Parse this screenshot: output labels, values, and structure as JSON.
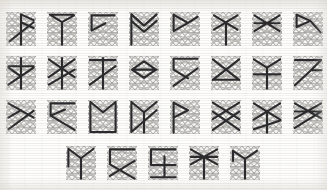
{
  "figure": {
    "canvas": {
      "width": 327,
      "height": 190
    },
    "palette": {
      "background": "#f5f4f1",
      "lattice_line": "#b5b4b1",
      "lattice_node": "#9e9d9a",
      "bold_path": "#2b2b2e"
    },
    "lattice": {
      "columns": 5,
      "rows": 5,
      "cell_width": 30,
      "cell_height": 34,
      "node_radius": 0.85
    },
    "rows": [
      {
        "index": 1,
        "top": 12,
        "left": 6,
        "pitch": 41,
        "count": 8,
        "cells": [
          {
            "id": "r1c1",
            "path": "M 0.50 0.07 L 0.92 0.24 M 0.50 0.07 L 0.50 0.96 M 0.50 0.30 L 0.92 0.47 M 0.12 0.86 L 0.92 0.30"
          },
          {
            "id": "r1c2",
            "path": "M 0.10 0.08 L 0.50 0.30 L 0.50 0.96 M 0.10 0.08 L 0.88 0.08 M 0.50 0.30 L 0.90 0.10"
          },
          {
            "id": "r1c3",
            "path": "M 0.12 0.10 L 0.88 0.10 M 0.12 0.10 L 0.12 0.55 L 0.58 0.33 L 0.12 0.55"
          },
          {
            "id": "r1c4",
            "path": "M 0.08 0.07 L 0.50 0.40 L 0.92 0.07 M 0.08 0.26 L 0.50 0.58 L 0.92 0.26 M 0.08 0.07 L 0.08 0.96"
          },
          {
            "id": "r1c5",
            "path": "M 0.12 0.08 L 0.60 0.32 L 0.12 0.56 L 0.12 0.08 M 0.60 0.32 L 0.92 0.14"
          },
          {
            "id": "r1c6",
            "path": "M 0.10 0.10 L 0.88 0.52 M 0.10 0.52 L 0.88 0.10 M 0.50 0.31 L 0.50 0.96"
          },
          {
            "id": "r1c7",
            "path": "M 0.08 0.10 L 0.92 0.56 M 0.08 0.56 L 0.92 0.10 M 0.08 0.33 L 0.92 0.33"
          },
          {
            "id": "r1c8",
            "path": "M 0.12 0.08 L 0.58 0.26 L 0.12 0.44 L 0.12 0.08 M 0.58 0.26 L 0.92 0.60"
          }
        ]
      },
      {
        "index": 2,
        "top": 56,
        "left": 6,
        "pitch": 41,
        "count": 8,
        "cells": [
          {
            "id": "r2c1",
            "path": "M 0.50 0.06 L 0.50 0.96 M 0.08 0.30 L 0.92 0.30 M 0.08 0.84 L 0.92 0.34 M 0.08 0.34 L 0.50 0.60"
          },
          {
            "id": "r2c2",
            "path": "M 0.50 0.06 L 0.50 0.96 M 0.06 0.10 L 0.92 0.62 M 0.06 0.62 L 0.92 0.10 M 0.06 0.84 L 0.92 0.40"
          },
          {
            "id": "r2c3",
            "path": "M 0.50 0.06 L 0.50 0.96 M 0.06 0.12 L 0.92 0.12 M 0.06 0.84 L 0.92 0.30"
          },
          {
            "id": "r2c4",
            "path": "M 0.50 0.16 L 0.90 0.40 L 0.50 0.64 L 0.10 0.40 Z M 0.10 0.40 L 0.92 0.40"
          },
          {
            "id": "r2c5",
            "path": "M 0.12 0.08 L 0.92 0.08 M 0.12 0.08 L 0.12 0.40 M 0.12 0.88 L 0.92 0.36 M 0.12 0.40 L 0.60 0.66"
          },
          {
            "id": "r2c6",
            "path": "M 0.06 0.10 L 0.50 0.40 L 0.94 0.10 M 0.06 0.70 L 0.50 0.40 M 0.50 0.40 L 0.94 0.70 M 0.06 0.70 L 0.94 0.70"
          },
          {
            "id": "r2c7",
            "path": "M 0.06 0.10 L 0.50 0.34 L 0.94 0.10 M 0.50 0.34 L 0.50 0.96 M 0.06 0.54 L 0.94 0.54"
          },
          {
            "id": "r2c8",
            "path": "M 0.06 0.12 L 0.94 0.12 M 0.06 0.86 L 0.60 0.42 L 0.94 0.42 M 0.60 0.42 L 0.94 0.12"
          }
        ]
      },
      {
        "index": 3,
        "top": 100,
        "left": 6,
        "pitch": 41,
        "count": 8,
        "cells": [
          {
            "id": "r3c1",
            "path": "M 0.08 0.10 L 0.92 0.52 M 0.08 0.86 L 0.92 0.32 M 0.08 0.52 L 0.50 0.30"
          },
          {
            "id": "r3c2",
            "path": "M 0.12 0.10 L 0.92 0.10 M 0.12 0.10 L 0.12 0.46 L 0.60 0.28 M 0.12 0.46 L 0.92 0.88"
          },
          {
            "id": "r3c3",
            "path": "M 0.08 0.06 L 0.50 0.36 L 0.92 0.06 M 0.08 0.06 L 0.08 0.94 M 0.92 0.06 L 0.92 0.94 M 0.08 0.94 L 0.92 0.94"
          },
          {
            "id": "r3c4",
            "path": "M 0.08 0.06 L 0.50 0.36 L 0.92 0.06 M 0.08 0.06 L 0.08 0.94 L 0.92 0.30 M 0.50 0.36 L 0.50 0.96"
          },
          {
            "id": "r3c5",
            "path": "M 0.12 0.08 L 0.60 0.30 L 0.12 0.52 L 0.12 0.08 M 0.12 0.52 L 0.12 0.96"
          },
          {
            "id": "r3c6",
            "path": "M 0.06 0.08 L 0.94 0.56 M 0.06 0.56 L 0.94 0.08 M 0.06 0.88 L 0.94 0.34 M 0.06 0.34 L 0.94 0.88"
          },
          {
            "id": "r3c7",
            "path": "M 0.06 0.10 L 0.94 0.58 M 0.06 0.58 L 0.94 0.10 M 0.06 0.86 L 0.94 0.60 M 0.50 0.34 L 0.50 0.96"
          },
          {
            "id": "r3c8",
            "path": "M 0.06 0.10 L 0.94 0.54 M 0.06 0.54 L 0.94 0.10 M 0.06 0.82 L 0.94 0.34 M 0.06 0.34 L 0.94 0.34"
          }
        ]
      },
      {
        "index": 4,
        "top": 146,
        "left": 66,
        "pitch": 41,
        "count": 5,
        "cells": [
          {
            "id": "r4c1",
            "path": "M 0.08 0.08 L 0.50 0.36 L 0.92 0.08 M 0.50 0.36 L 0.50 0.96 M 0.08 0.08 L 0.08 0.60"
          },
          {
            "id": "r4c2",
            "path": "M 0.10 0.10 L 0.92 0.10 M 0.10 0.10 L 0.10 0.54 M 0.10 0.54 L 0.92 0.96 M 0.10 0.88 L 0.92 0.44"
          },
          {
            "id": "r4c3",
            "path": "M 0.10 0.10 L 0.92 0.10 M 0.10 0.10 L 0.10 0.56 M 0.55 0.30 L 0.55 0.92 M 0.10 0.56 L 0.92 0.56 M 0.10 0.92 L 0.92 0.92"
          },
          {
            "id": "r4c4",
            "path": "M 0.06 0.10 L 0.94 0.54 M 0.06 0.54 L 0.94 0.10 M 0.50 0.32 L 0.50 0.96 M 0.06 0.32 L 0.94 0.32"
          },
          {
            "id": "r4c5",
            "path": "M 0.10 0.14 L 0.50 0.38 L 0.90 0.14 M 0.50 0.38 L 0.50 0.96 M 0.10 0.14 L 0.10 0.44"
          }
        ]
      }
    ]
  }
}
